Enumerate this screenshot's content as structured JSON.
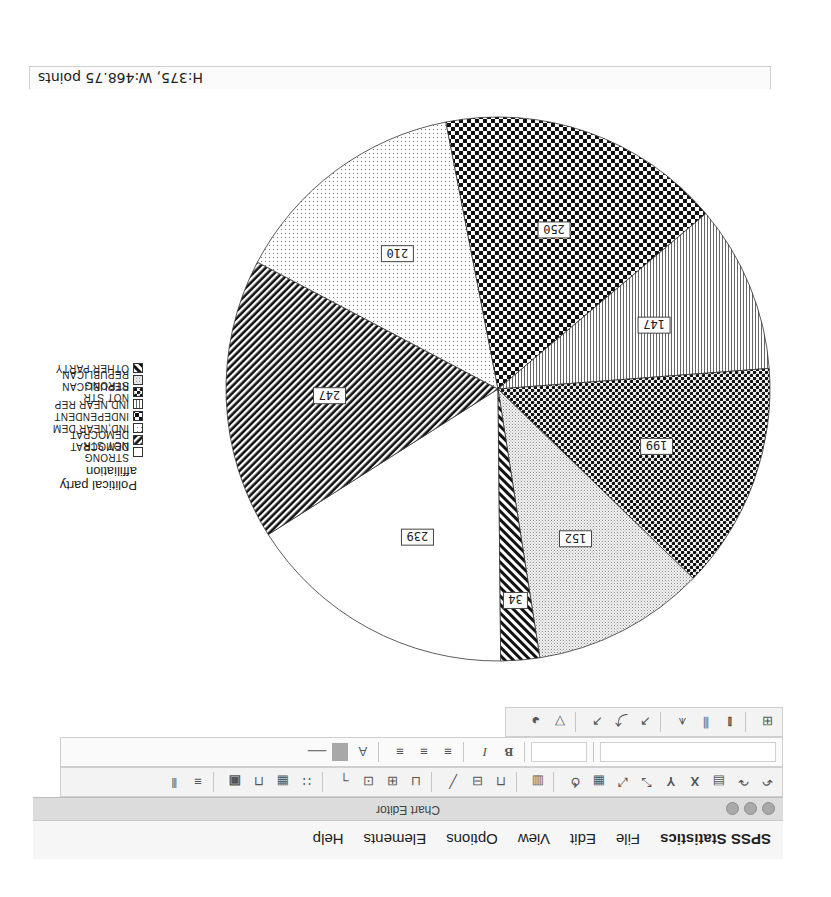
{
  "menubar": {
    "app_name": "SPSS Statistics",
    "items": [
      "File",
      "Edit",
      "View",
      "Options",
      "Elements",
      "Help"
    ]
  },
  "window": {
    "title": "Chart Editor"
  },
  "toolbar": {
    "row1_icons": [
      "undo-icon",
      "redo-icon",
      "properties-icon",
      "x-axis-icon",
      "y-axis-icon",
      "rescale-icon",
      "scale-icon",
      "fill-icon",
      "lasso-icon",
      "chart-type-icon",
      "title-icon",
      "footnote-icon",
      "textbox-icon",
      "annotation-icon",
      "legend-icon",
      "reference-line-icon",
      "gridlines-icon",
      "table-icon",
      "data-label-icon",
      "transpose-icon",
      "options-icon"
    ],
    "row2": {
      "font_size_field": "",
      "style_field": "",
      "bold_label": "B",
      "italic_label": "I",
      "align_icons": [
        "align-left-icon",
        "align-center-icon",
        "align-right-icon"
      ],
      "text_color_label": "A"
    },
    "row3_icons": [
      "gridlines-icon",
      "bar-label-icon",
      "bar-icon",
      "series-icon",
      "line-icon",
      "markers-icon",
      "smooth-icon",
      "fit-line-icon",
      "filter-icon",
      "pie-explode-icon"
    ]
  },
  "status": {
    "size_text": "H:375, W:468.75 points"
  },
  "legend": {
    "title_line1": "Political party",
    "title_line2": "affiliation",
    "items": [
      {
        "label": "STRONG DEMOCRAT",
        "pattern": "white"
      },
      {
        "label": "NOT STR DEMOCRAT",
        "pattern": "diag-dense"
      },
      {
        "label": "IND,NEAR DEM",
        "pattern": "dots-fine"
      },
      {
        "label": "INDEPENDENT",
        "pattern": "check-large"
      },
      {
        "label": "IND,NEAR REP",
        "pattern": "vlines"
      },
      {
        "label": "NOT STR REPUBLICAN",
        "pattern": "check"
      },
      {
        "label": "STRONG REPUBLICAN",
        "pattern": "dots"
      },
      {
        "label": "OTHER PARTY",
        "pattern": "diag"
      }
    ]
  },
  "chart_data": {
    "type": "pie",
    "title": "",
    "legend_title": "Political party affiliation",
    "legend_position": "right",
    "categories": [
      "STRONG DEMOCRAT",
      "NOT STR DEMOCRAT",
      "IND,NEAR DEM",
      "INDEPENDENT",
      "IND,NEAR REP",
      "NOT STR REPUBLICAN",
      "STRONG REPUBLICAN",
      "OTHER PARTY"
    ],
    "slices_in_drawing_order": [
      {
        "label": "STRONG DEMOCRAT",
        "value": 239
      },
      {
        "label": "NOT STR DEMOCRAT",
        "value": 247
      },
      {
        "label": "IND,NEAR DEM",
        "value": 210
      },
      {
        "label": "INDEPENDENT",
        "value": 250
      },
      {
        "label": "IND,NEAR REP",
        "value": 147
      },
      {
        "label": "NOT STR REPUBLICAN",
        "value": 199
      },
      {
        "label": "STRONG REPUBLICAN",
        "value": 152
      },
      {
        "label": "OTHER PARTY",
        "value": 34
      }
    ],
    "values": [
      239,
      247,
      210,
      250,
      147,
      199,
      152,
      34
    ],
    "data_labels": [
      "239",
      "247",
      "210",
      "250",
      "147",
      "199",
      "152",
      "34"
    ],
    "total": 1478
  }
}
